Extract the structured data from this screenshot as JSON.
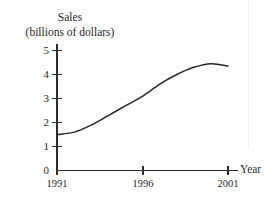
{
  "chart_data": {
    "type": "line",
    "title": "Sales",
    "subtitle": "(billions of dollars)",
    "xlabel": "Year",
    "ylabel": "Sales (billions of dollars)",
    "xlim": [
      1991,
      2001
    ],
    "ylim": [
      0,
      5
    ],
    "grid": false,
    "legend": null,
    "x_ticks": [
      "1991",
      "1996",
      "2001"
    ],
    "x_tick_values": [
      1991,
      1996,
      2001
    ],
    "y_ticks": [
      "0",
      "1",
      "2",
      "3",
      "4",
      "5"
    ],
    "y_tick_values": [
      0,
      1,
      2,
      3,
      4,
      5
    ],
    "series": [
      {
        "name": "Sales",
        "color": "#262626",
        "x": [
          1991,
          1992,
          1993,
          1994,
          1995,
          1996,
          1997,
          1998,
          1999,
          2000,
          2001
        ],
        "values": [
          1.5,
          1.6,
          1.9,
          2.3,
          2.7,
          3.1,
          3.6,
          4.0,
          4.3,
          4.45,
          4.35
        ]
      }
    ],
    "annotations": []
  },
  "axes": {
    "x_axis_name": "Year",
    "y_title_line1": "Sales",
    "y_title_line2": "(billions of dollars)"
  },
  "colors": {
    "curve": "#262626",
    "axis": "#2b2b2b",
    "background": "#ffffff",
    "text": "#1f1f1f"
  }
}
